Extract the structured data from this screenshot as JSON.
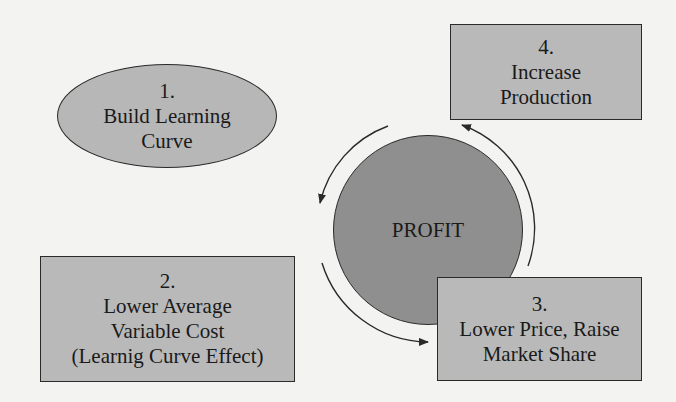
{
  "diagram": {
    "type": "cycle",
    "center": {
      "label": "PROFIT",
      "shape": "circle",
      "fill": "#8f8f8f"
    },
    "nodes": [
      {
        "id": "1",
        "number": "1.",
        "lines": [
          "Build Learning",
          "Curve"
        ],
        "shape": "ellipse",
        "fill": "#b7b7b7"
      },
      {
        "id": "2",
        "number": "2.",
        "lines": [
          "Lower Average",
          "Variable Cost",
          "(Learnig Curve Effect)"
        ],
        "shape": "rectangle",
        "fill": "#b9b9b9"
      },
      {
        "id": "3",
        "number": "3.",
        "lines": [
          "Lower Price, Raise",
          "Market Share"
        ],
        "shape": "rectangle",
        "fill": "#b9b9b9"
      },
      {
        "id": "4",
        "number": "4.",
        "lines": [
          "Increase",
          "Production"
        ],
        "shape": "rectangle",
        "fill": "#b9b9b9"
      }
    ],
    "edges": [
      {
        "from": "4",
        "to": "1",
        "style": "curved arrow (counter-clockwise, top-left arc)"
      },
      {
        "from": "1",
        "to": "3",
        "style": "curved arrow (bottom-left arc, pointing right)"
      },
      {
        "from": "3",
        "to": "4",
        "style": "curved arrow (right arc, pointing up)"
      }
    ],
    "colors": {
      "background": "#f3f3f1",
      "stroke": "#2a2a2a",
      "box_fill": "#b9b9b9",
      "center_fill": "#8f8f8f"
    }
  }
}
